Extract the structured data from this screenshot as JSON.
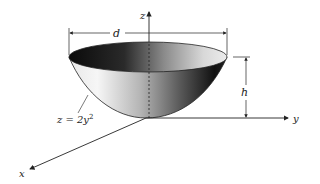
{
  "diagram": {
    "type": "3d-paraboloid-bowl",
    "labels": {
      "z_axis": "z",
      "y_axis": "y",
      "x_axis": "x",
      "diameter": "d",
      "height": "h",
      "equation_main": "z = 2y",
      "equation_exp": "2"
    },
    "colors": {
      "line": "#222222",
      "shade_dark": "#1a1a1a",
      "shade_light": "#f2f2f2",
      "background": "#ffffff"
    }
  }
}
